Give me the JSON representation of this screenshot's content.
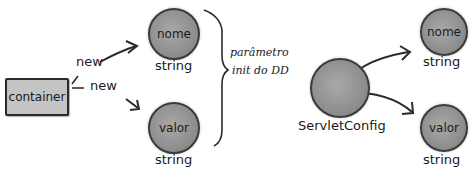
{
  "left_diagram": {
    "container_label": "container",
    "arrow_labels": [
      "new",
      "new"
    ],
    "nodes": [
      {
        "label": "nome",
        "type": "string"
      },
      {
        "label": "valor",
        "type": "string"
      }
    ]
  },
  "brace_annotation": {
    "line1": "parâmetro",
    "line2": "init do DD"
  },
  "right_diagram": {
    "source_label": "ServletConfig",
    "nodes": [
      {
        "label": "nome",
        "type": "string"
      },
      {
        "label": "valor",
        "type": "string"
      }
    ]
  },
  "colors": {
    "node_fill": "#8f8f8f",
    "box_fill": "#c4c4c4",
    "stroke": "#2a2a2a"
  }
}
